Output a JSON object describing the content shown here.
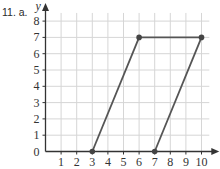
{
  "question_label": "11. a.",
  "chart_data": {
    "type": "line",
    "title": "",
    "xlabel": "x",
    "ylabel": "y",
    "xlim": [
      0,
      10.5
    ],
    "ylim": [
      0,
      8.5
    ],
    "x_ticks": [
      1,
      2,
      3,
      4,
      5,
      6,
      7,
      8,
      9,
      10
    ],
    "y_ticks": [
      0,
      1,
      2,
      3,
      4,
      5,
      6,
      7,
      8
    ],
    "grid": true,
    "legend": null,
    "series": [
      {
        "name": "parallelogram",
        "points": [
          [
            3,
            0
          ],
          [
            6,
            7
          ],
          [
            10,
            7
          ],
          [
            7,
            0
          ]
        ],
        "segments": [
          [
            [
              3,
              0
            ],
            [
              6,
              7
            ]
          ],
          [
            [
              6,
              7
            ],
            [
              10,
              7
            ]
          ],
          [
            [
              10,
              7
            ],
            [
              7,
              0
            ]
          ]
        ],
        "color": "#555555"
      }
    ]
  },
  "colors": {
    "grid": "#d6d6d6",
    "axis": "#333333",
    "line": "#555555",
    "point": "#444444"
  }
}
